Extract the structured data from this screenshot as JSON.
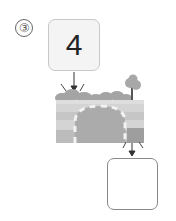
{
  "problem": {
    "number_label": "③",
    "input_value": "4",
    "output_value": ""
  },
  "illustration": {
    "description": "tunnel-machine",
    "colors": {
      "bush": "#a4a4a4",
      "ground_light": "#d4d4d4",
      "ground_mid": "#bdbdbd",
      "ground_dark": "#9e9e9e",
      "tunnel": "#ababab",
      "dashes": "#f2f2f2",
      "tree_trunk": "#555555",
      "tree_crown": "#a8a8a8"
    }
  }
}
